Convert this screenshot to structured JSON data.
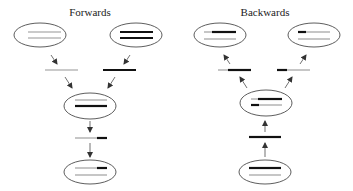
{
  "panels": {
    "forwards": {
      "title": "Forwards"
    },
    "backwards": {
      "title": "Backwards"
    }
  },
  "colors": {
    "dark_strand": "#111111",
    "light_strand": "#b8b8b8",
    "outline": "#333333",
    "arrow": "#333333"
  },
  "legend_semantics": {
    "dark_strand": "black bar",
    "light_strand": "gray bar"
  }
}
